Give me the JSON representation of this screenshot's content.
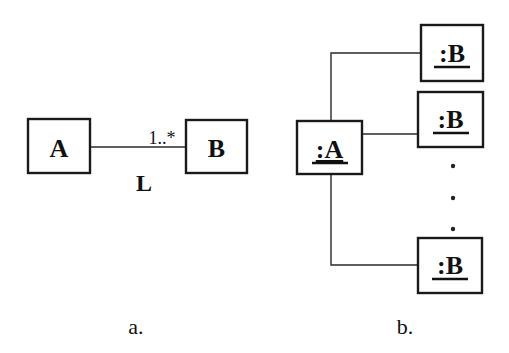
{
  "diagram_a": {
    "caption": "a.",
    "class_a": {
      "label": "A"
    },
    "class_b": {
      "label": "B"
    },
    "association": {
      "name": "L",
      "multiplicity": "1..*"
    }
  },
  "diagram_b": {
    "caption": "b.",
    "object_a": {
      "label": ":A"
    },
    "objects_b": [
      {
        "label": ":B"
      },
      {
        "label": ":B"
      },
      {
        "label": ":B"
      }
    ],
    "ellipsis": "..."
  },
  "colors": {
    "stroke": "#1a1a1a",
    "background": "#ffffff"
  }
}
